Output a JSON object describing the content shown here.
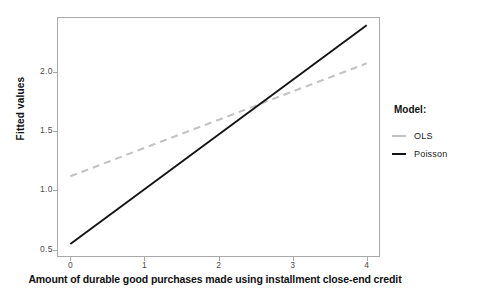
{
  "chart_data": {
    "type": "line",
    "title": "",
    "xlabel": "Amount of durable good purchases made using installment close-end credit",
    "ylabel": "Fitted values",
    "xlim": [
      -0.18,
      4.18
    ],
    "ylim": [
      0.44,
      2.46
    ],
    "xticks": [
      0,
      1,
      2,
      3,
      4
    ],
    "xtick_labels": [
      "0",
      "1",
      "2",
      "3",
      "4"
    ],
    "yticks": [
      0.5,
      1.0,
      1.5,
      2.0
    ],
    "ytick_labels": [
      "0.5",
      "1.0",
      "1.5",
      "2.0"
    ],
    "grid": false,
    "legend_position": "right",
    "legend_title": "Model:",
    "x": [
      0,
      4
    ],
    "series": [
      {
        "name": "OLS",
        "values": [
          1.12,
          2.07
        ],
        "color": "#c3c3c3",
        "style": "dashed",
        "width": 2.0
      },
      {
        "name": "Poisson",
        "values": [
          0.55,
          2.39
        ],
        "color": "#141414",
        "style": "solid",
        "width": 1.8
      }
    ],
    "annotations": []
  },
  "legend": {
    "title": "Model:",
    "entries": [
      {
        "label": "OLS",
        "color": "#c3c3c3",
        "style": "dashed"
      },
      {
        "label": "Poisson",
        "color": "#141414",
        "style": "solid"
      }
    ]
  },
  "axes": {
    "y_title": "Fitted values",
    "x_title": "Amount of durable good purchases made using installment close-end credit",
    "y_labels": [
      "2.0",
      "1.5",
      "1.0",
      "0.5"
    ],
    "x_labels": [
      "0",
      "1",
      "2",
      "3",
      "4"
    ]
  }
}
